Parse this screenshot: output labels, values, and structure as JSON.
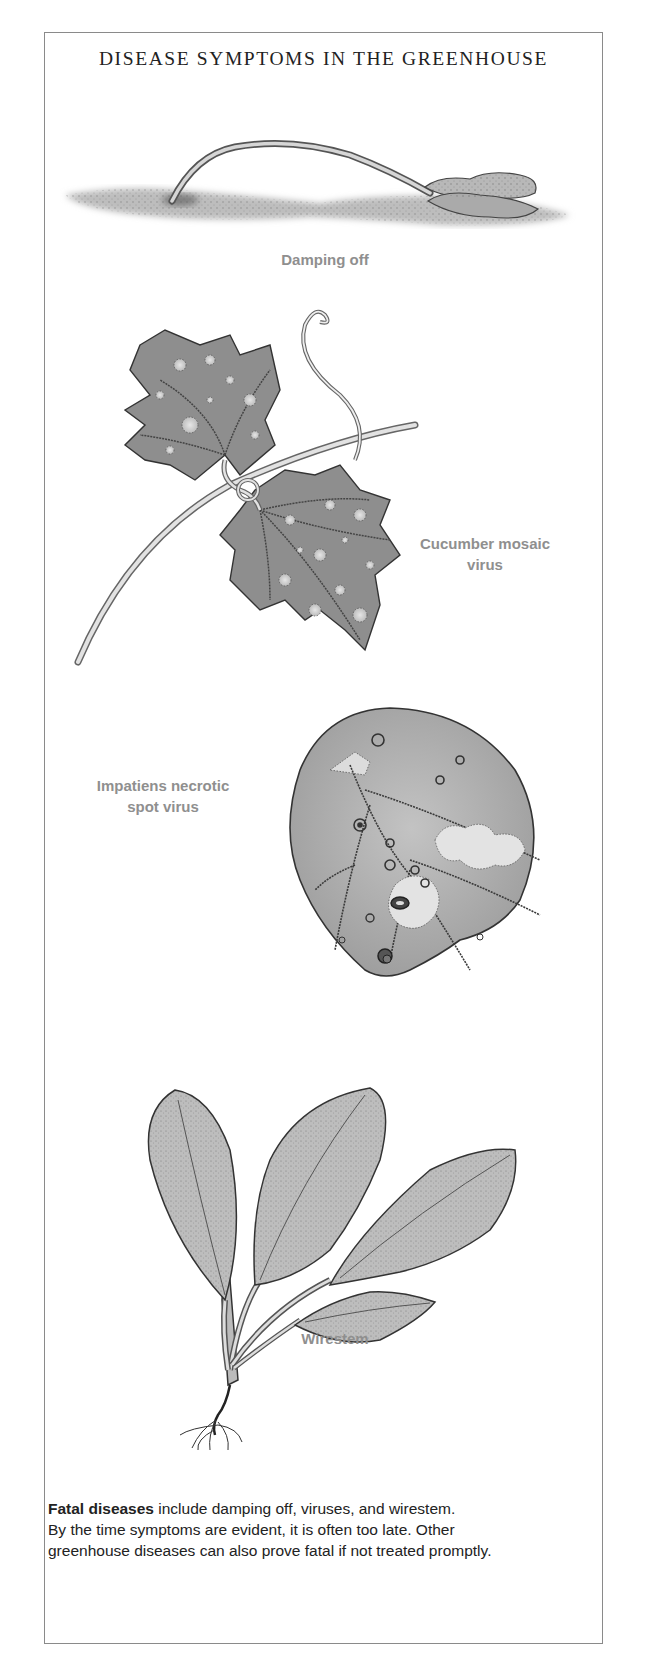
{
  "document": {
    "title": "DISEASE SYMPTOMS IN THE GREENHOUSE",
    "illustrations": [
      {
        "id": "damping-off",
        "label": "Damping off"
      },
      {
        "id": "cucumber-mosaic",
        "label_line1": "Cucumber mosaic",
        "label_line2": "virus"
      },
      {
        "id": "impatiens-necrotic",
        "label_line1": "Impatiens necrotic",
        "label_line2": "spot virus"
      },
      {
        "id": "wirestem",
        "label": "Wirestem"
      }
    ],
    "caption": {
      "bold_lead": "Fatal diseases",
      "line1_rest": " include damping off, viruses, and wirestem.",
      "line2": "By the time symptoms are evident, it is often too late. Other",
      "line3": "greenhouse diseases can also prove fatal if not treated promptly."
    },
    "colors": {
      "border": "#8a8a8a",
      "label_gray": "#8f8f8f",
      "text_dark": "#222222",
      "leaf_gray": "#9a9a9a",
      "leaf_light": "#c8c8c8"
    }
  }
}
